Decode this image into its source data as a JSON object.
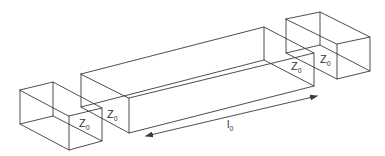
{
  "diagram": {
    "labels": {
      "left_box": {
        "main": "Z",
        "sub": "0"
      },
      "middle_box": {
        "main": "Z",
        "sub": "0"
      },
      "middle_box_right": {
        "main": "Z",
        "sub": "0"
      },
      "right_box": {
        "main": "Z",
        "sub": "0"
      },
      "length": {
        "main": "l",
        "sub": "0"
      }
    },
    "colors": {
      "stroke": "#3a3a3a",
      "text": "#333333",
      "background": "#ffffff"
    }
  }
}
